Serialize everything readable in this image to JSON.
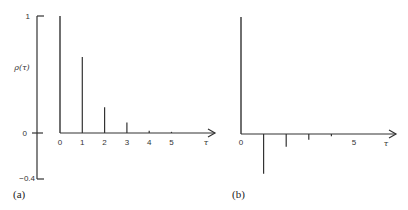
{
  "chart_data": [
    {
      "type": "bar",
      "panel": "(a)",
      "title": "",
      "xlabel": "τ",
      "ylabel": "ρ(τ)",
      "x": [
        0,
        1,
        2,
        3,
        4,
        5
      ],
      "values": [
        1.0,
        0.65,
        0.22,
        0.09,
        0.02,
        0.01
      ],
      "x_tick_labels": [
        "0",
        "1",
        "2",
        "3",
        "4",
        "5"
      ],
      "y_tick_labels": [
        "1",
        "0",
        "-0.4"
      ],
      "ylim": [
        -0.4,
        1
      ],
      "grid": false
    },
    {
      "type": "bar",
      "panel": "(b)",
      "title": "",
      "xlabel": "τ",
      "ylabel": "",
      "x": [
        0,
        1,
        2,
        3,
        4,
        5
      ],
      "values": [
        1.0,
        -0.34,
        -0.11,
        -0.05,
        -0.02,
        0.0
      ],
      "x_tick_labels": [
        "0",
        "5"
      ],
      "ylim": [
        -0.4,
        1
      ],
      "grid": false
    }
  ],
  "labels": {
    "panel_a": "(a)",
    "panel_b": "(b)",
    "ylabel_a": "ρ(τ)",
    "xlabel": "τ",
    "y_top": "1",
    "y_zero": "0",
    "y_bottom": "−0.4",
    "a_ticks": [
      "0",
      "1",
      "2",
      "3",
      "4",
      "5"
    ],
    "b_ticks": [
      "0",
      "5"
    ]
  }
}
